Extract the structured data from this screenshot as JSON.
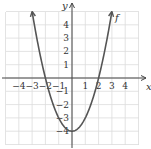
{
  "chart_data": {
    "type": "line",
    "title": "",
    "xlabel": "x",
    "ylabel": "y",
    "xlim": [
      -5,
      5
    ],
    "ylim": [
      -5,
      5
    ],
    "grid": true,
    "x_ticks": [
      "-4",
      "-3",
      "-2",
      "-1",
      "1",
      "2",
      "3",
      "4"
    ],
    "y_ticks": [
      "4",
      "3",
      "2",
      "1",
      "-1",
      "-2",
      "-3",
      "-4"
    ],
    "series": [
      {
        "name": "f",
        "formula": "x^2 - 4",
        "x": [
          -3,
          -2,
          -1,
          0,
          1,
          2,
          3
        ],
        "y": [
          5,
          0,
          -3,
          -4,
          -3,
          0,
          5
        ],
        "color": "#555555"
      }
    ],
    "annotations": [
      {
        "text": "f",
        "x": 3.2,
        "y": 5
      }
    ]
  },
  "labels": {
    "x": "x",
    "y": "y",
    "curve": "f"
  }
}
